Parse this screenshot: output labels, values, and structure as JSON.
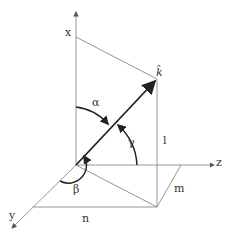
{
  "diagram": {
    "labels": {
      "x_axis": "x",
      "y_axis": "y",
      "z_axis": "z",
      "vector": "k̂",
      "alpha": "α",
      "beta": "β",
      "gamma": "γ",
      "l": "l",
      "m": "m",
      "n": "n"
    },
    "colors": {
      "axis": "#8a8a8a",
      "vector": "#222222",
      "text": "#333333"
    }
  }
}
